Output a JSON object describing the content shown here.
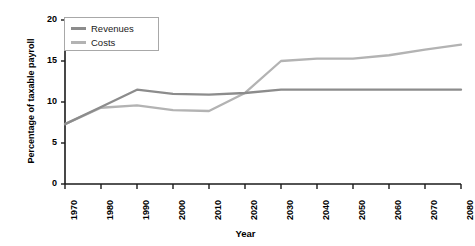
{
  "chart_data": {
    "type": "line",
    "title": "",
    "xlabel": "Year",
    "ylabel": "Percentage of taxable payroll",
    "xlim": [
      1970,
      2080
    ],
    "ylim": [
      0,
      20
    ],
    "xticks": [
      1970,
      1980,
      1990,
      2000,
      2010,
      2020,
      2030,
      2040,
      2050,
      2060,
      2070,
      2080
    ],
    "yticks": [
      0,
      5,
      10,
      15,
      20
    ],
    "grid": false,
    "legend_position": "top-left",
    "x": [
      1970,
      1980,
      1990,
      2000,
      2010,
      2020,
      2030,
      2040,
      2050,
      2060,
      2070,
      2080
    ],
    "series": [
      {
        "name": "Revenues",
        "color": "#8c8c8c",
        "values": [
          7.3,
          9.4,
          11.5,
          11.0,
          10.9,
          11.1,
          11.5,
          11.5,
          11.5,
          11.5,
          11.5,
          11.5
        ]
      },
      {
        "name": "Costs",
        "color": "#b3b3b3",
        "values": [
          7.3,
          9.3,
          9.6,
          9.0,
          8.9,
          11.1,
          15.0,
          15.3,
          15.3,
          15.7,
          16.4,
          17.0
        ]
      }
    ]
  },
  "legend": {
    "entries": [
      {
        "label": "Revenues",
        "color": "#8c8c8c"
      },
      {
        "label": "Costs",
        "color": "#b3b3b3"
      }
    ]
  },
  "axes": {
    "y_title": "Percentage of taxable payroll",
    "x_title": "Year",
    "y_tick_labels": [
      "20",
      "15",
      "10",
      "5",
      "0"
    ],
    "x_tick_labels": [
      "1970",
      "1980",
      "1990",
      "2000",
      "2010",
      "2020",
      "2030",
      "2040",
      "2050",
      "2060",
      "2070",
      "2080"
    ]
  },
  "colors": {
    "axis": "#1a1a1a",
    "revenues": "#8c8c8c",
    "costs": "#b3b3b3",
    "legend_border": "#a8a8a8",
    "background": "#ffffff"
  }
}
